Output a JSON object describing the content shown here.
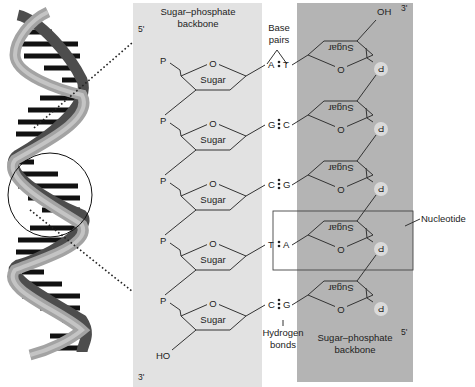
{
  "figure": {
    "type": "dna-structure",
    "colors": {
      "left_panel": "#e2e2e2",
      "right_panel": "#b4b4b4",
      "line": "#333333",
      "phosphate_circle": "#d9d9d9",
      "helix_strand_light": "#a8a8a8",
      "helix_strand_dark": "#555555",
      "helix_rungs": "#111111"
    },
    "left_strand": {
      "title_line1": "Sugar–phosphate",
      "title_line2": "backbone",
      "top_end": "5'",
      "bottom_end": "3'",
      "terminal_group": "HO",
      "phosphate_label": "P",
      "sugar_label": "Sugar",
      "ring_oxygen": "O"
    },
    "right_strand": {
      "title_line1": "Sugar–phosphate",
      "title_line2": "backbone",
      "top_end": "3'",
      "bottom_end": "5'",
      "terminal_group": "OH",
      "phosphate_label": "P",
      "sugar_label": "Sugar",
      "ring_oxygen": "O"
    },
    "base_pairs_label_line1": "Base",
    "base_pairs_label_line2": "pairs",
    "hydrogen_bonds_label_line1": "Hydrogen",
    "hydrogen_bonds_label_line2": "bonds",
    "nucleotide_label": "Nucleotide",
    "pairs": [
      {
        "left": "A",
        "right": "T",
        "h_bonds": 2
      },
      {
        "left": "G",
        "right": "C",
        "h_bonds": 3
      },
      {
        "left": "C",
        "right": "G",
        "h_bonds": 3
      },
      {
        "left": "T",
        "right": "A",
        "h_bonds": 2
      },
      {
        "left": "C",
        "right": "G",
        "h_bonds": 3
      }
    ]
  }
}
